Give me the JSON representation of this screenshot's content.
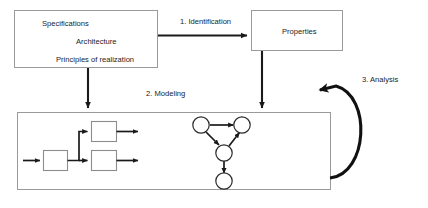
{
  "diagram": {
    "colors": {
      "background": "#ffffff",
      "box_stroke": "#9a9a9a",
      "inner_box_stroke": "#8d8d8d",
      "arrow": "#1a1a1a",
      "loop_arrow": "#111111",
      "text": "#1c1c1c",
      "node_stroke": "#2b2b2b"
    },
    "requirements_box": {
      "lines": [
        "Specifications",
        "Architecture",
        "Principles of realization"
      ]
    },
    "properties_box": {
      "label": "Properties"
    },
    "step_labels": [
      "1. Identification",
      "2. Modeling",
      "3. Analysis"
    ],
    "model_box": {
      "block_diagram_blocks": 3,
      "graph_nodes": 4,
      "graph_edges": 4
    }
  }
}
